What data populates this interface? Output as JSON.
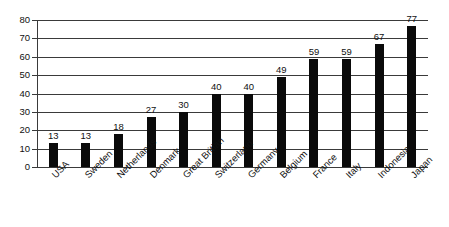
{
  "chart_data": {
    "type": "bar",
    "title": "",
    "xlabel": "",
    "ylabel": "",
    "categories": [
      "USA",
      "Sweden",
      "Netherlands",
      "Denmark",
      "Great Britian",
      "Switzerland",
      "Germany",
      "Belgium",
      "France",
      "Italy",
      "Indonesia",
      "Japan"
    ],
    "values": [
      13,
      13,
      18,
      27,
      30,
      40,
      40,
      49,
      59,
      59,
      67,
      77
    ],
    "value_labels": [
      "13",
      "13",
      "18",
      "27",
      "30",
      "40",
      "40",
      "49",
      "59",
      "59",
      "67",
      "77"
    ],
    "ylim": [
      0,
      80
    ],
    "ytick_labels": [
      "0",
      "10",
      "20",
      "30",
      "40",
      "50",
      "60",
      "70",
      "80"
    ],
    "yticks": [
      0,
      10,
      20,
      30,
      40,
      50,
      60,
      70,
      80
    ],
    "grid": true,
    "legend": false,
    "bar_color": "#0a0a0a",
    "grid_color": "#3a3a3a",
    "axis_color": "#3a3a3a",
    "text_color": "#111111",
    "background_color": "#ffffff",
    "category_label_rotation_deg": -45
  }
}
